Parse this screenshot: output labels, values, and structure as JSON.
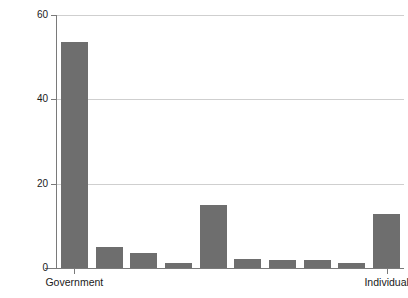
{
  "chart_data": {
    "type": "bar",
    "title": "",
    "subtitle": "",
    "xlabel": "",
    "ylabel": "Percent",
    "ylim": [
      0,
      60
    ],
    "yticks": [
      0,
      20,
      40,
      60
    ],
    "ytick_labels": [
      "0",
      "20",
      "40",
      "60"
    ],
    "grid": "horizontal",
    "legend": "none",
    "bar_color": "#6e6e6e",
    "gridline_color": "#cfcfcf",
    "axis_color": "#7a7a7a",
    "categories": [
      "Government",
      "",
      "",
      "",
      "",
      "",
      "",
      "",
      "",
      "Individual"
    ],
    "labeled_ticks": [
      {
        "index": 0,
        "label": "Government"
      },
      {
        "index": 9,
        "label": "Individual"
      }
    ],
    "values": [
      53.7,
      5.1,
      3.6,
      1.2,
      15.0,
      2.2,
      2.0,
      2.0,
      1.2,
      12.8
    ],
    "bars": [
      {
        "category": "Government",
        "value": 53.7
      },
      {
        "category": "",
        "value": 5.1
      },
      {
        "category": "",
        "value": 3.6
      },
      {
        "category": "",
        "value": 1.2
      },
      {
        "category": "",
        "value": 15.0
      },
      {
        "category": "",
        "value": 2.2
      },
      {
        "category": "",
        "value": 2.0
      },
      {
        "category": "",
        "value": 2.0
      },
      {
        "category": "",
        "value": 1.2
      },
      {
        "category": "Individual",
        "value": 12.8
      }
    ]
  }
}
